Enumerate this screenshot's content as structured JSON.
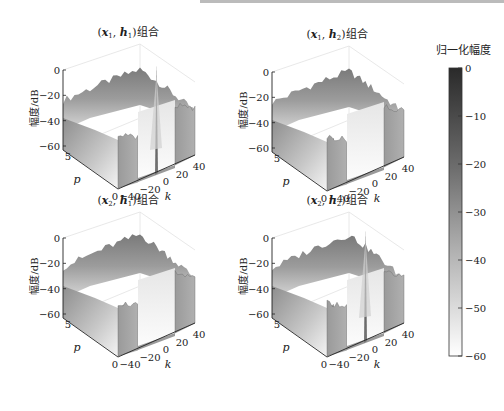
{
  "chart_data": {
    "type": "surface3d",
    "subplots": [
      {
        "id": "x1h1",
        "title_prefix": "(",
        "title_x": "x",
        "title_x_sub": "1",
        "title_sep": ", ",
        "title_h": "h",
        "title_h_sub": "1",
        "title_suffix": ")组合",
        "zlabel": "幅度/dB",
        "xlabel": "k",
        "ylabel": "p",
        "zticks": [
          "0",
          "−20",
          "−40",
          "−60"
        ],
        "kticks": [
          "−40",
          "−20",
          "0",
          "20",
          "40"
        ],
        "pticks": [
          "5",
          "0"
        ],
        "zlim": [
          -60,
          0
        ],
        "klim": [
          -45,
          45
        ],
        "plim": [
          0,
          5
        ],
        "passband_k": [
          -22,
          25
        ],
        "passband_level_db": -58,
        "stopband_level_db": [
          -28,
          -20
        ],
        "center_spike": true,
        "spike_k": 2,
        "spike_peak_db": -14
      },
      {
        "id": "x1h2",
        "title_prefix": "(",
        "title_x": "x",
        "title_x_sub": "1",
        "title_sep": ", ",
        "title_h": "h",
        "title_h_sub": "2",
        "title_suffix": ")组合",
        "zlabel": "幅度/dB",
        "xlabel": "k",
        "ylabel": "p",
        "zticks": [
          "0",
          "−20",
          "−40",
          "−60"
        ],
        "kticks": [
          "−40",
          "−20",
          "0",
          "20",
          "40"
        ],
        "pticks": [
          "5",
          "0"
        ],
        "zlim": [
          -60,
          0
        ],
        "klim": [
          -45,
          45
        ],
        "plim": [
          0,
          5
        ],
        "passband_k": [
          -22,
          25
        ],
        "passband_level_db": -58,
        "stopband_level_db": [
          -28,
          -20
        ],
        "center_spike": false
      },
      {
        "id": "x2h1",
        "title_prefix": "(",
        "title_x": "x",
        "title_x_sub": "2",
        "title_sep": ", ",
        "title_h": "h",
        "title_h_sub": "1",
        "title_suffix": ")组合",
        "zlabel": "幅度/dB",
        "xlabel": "k",
        "ylabel": "p",
        "zticks": [
          "0",
          "−20",
          "−40",
          "−60"
        ],
        "kticks": [
          "−40",
          "−20",
          "0",
          "20",
          "40"
        ],
        "pticks": [
          "5",
          "0"
        ],
        "zlim": [
          -60,
          0
        ],
        "klim": [
          -45,
          45
        ],
        "plim": [
          0,
          5
        ],
        "passband_k": [
          -22,
          25
        ],
        "passband_level_db": -58,
        "stopband_level_db": [
          -28,
          -18
        ],
        "center_spike": false
      },
      {
        "id": "x2h2",
        "title_prefix": "(",
        "title_x": "x",
        "title_x_sub": "2",
        "title_sep": ", ",
        "title_h": "h",
        "title_h_sub": "2",
        "title_suffix": ")组合",
        "zlabel": "幅度/dB",
        "xlabel": "k",
        "ylabel": "p",
        "zticks": [
          "0",
          "−20",
          "−40",
          "−60"
        ],
        "kticks": [
          "−40",
          "−20",
          "0",
          "20",
          "40"
        ],
        "pticks": [
          "5",
          "0"
        ],
        "zlim": [
          -60,
          0
        ],
        "klim": [
          -45,
          45
        ],
        "plim": [
          0,
          5
        ],
        "passband_k": [
          -22,
          25
        ],
        "passband_level_db": -58,
        "stopband_level_db": [
          -30,
          -18
        ],
        "center_spike": true,
        "spike_k": 2,
        "spike_peak_db": -12
      }
    ],
    "colorbar": {
      "title": "归一化幅度",
      "ticks": [
        "0",
        "−10",
        "−20",
        "−30",
        "−40",
        "−50",
        "−60"
      ],
      "range": [
        -60,
        0
      ],
      "colormap": "gray-reversed",
      "color_high": "#2a2a2a",
      "color_mid": "#8c8c8c",
      "color_low": "#ffffff"
    },
    "layout": {
      "grid": false,
      "legend": "colorbar-right"
    }
  }
}
